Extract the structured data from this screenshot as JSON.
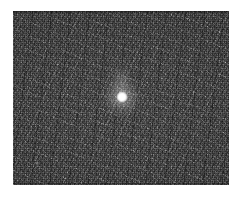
{
  "figure": {
    "kind": "grayscale-noise-image",
    "canvas": {
      "width": 244,
      "height": 202,
      "background_color": "#ffffff"
    },
    "panel": {
      "name": "image-panel",
      "left": 13,
      "top": 11,
      "width": 216,
      "height": 174,
      "background_color": "#343434",
      "noise": "fine-grained salt-and-pepper, 1px scale, high amplitude"
    },
    "features": [
      {
        "name": "point-source",
        "label": "bright point source",
        "center_x": 122,
        "center_y": 97,
        "core_diameter": 12,
        "halo_diameter": 44,
        "peak_color": "#ffffff",
        "saturated": "true"
      },
      {
        "name": "point-source-plume",
        "label": "faint diffuse plume above source",
        "center_x": 121,
        "center_y": 80,
        "width": 26,
        "height": 40
      },
      {
        "name": "faint-speck",
        "label": "faint secondary speck",
        "center_x": 37,
        "center_y": 163,
        "diameter": 4
      }
    ],
    "margins": {
      "top_label": "",
      "bottom_label": "",
      "left_label": "",
      "right_label": ""
    }
  }
}
